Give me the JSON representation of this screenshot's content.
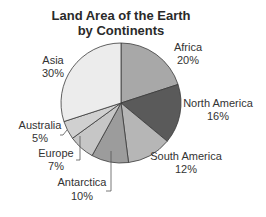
{
  "chart_data": {
    "type": "pie",
    "title": "Land Area of the Earth by Continents",
    "title_lines": [
      "Land Area of the Earth",
      "by Continents"
    ],
    "start_angle_deg": 0,
    "direction": "clockwise",
    "slices": [
      {
        "label": "Africa",
        "value": 20,
        "value_label": "20%",
        "color": "#a8a8a8"
      },
      {
        "label": "North America",
        "value": 16,
        "value_label": "16%",
        "color": "#5a5a5a"
      },
      {
        "label": "South America",
        "value": 12,
        "value_label": "12%",
        "color": "#b6b6b6"
      },
      {
        "label": "Antarctica",
        "value": 10,
        "value_label": "10%",
        "color": "#9c9c9c"
      },
      {
        "label": "Europe",
        "value": 7,
        "value_label": "7%",
        "color": "#c6c6c6"
      },
      {
        "label": "Australia",
        "value": 5,
        "value_label": "5%",
        "color": "#d0d0d0"
      },
      {
        "label": "Asia",
        "value": 30,
        "value_label": "30%",
        "color": "#ececec"
      }
    ],
    "categories": [
      "Africa",
      "North America",
      "South America",
      "Antarctica",
      "Europe",
      "Australia",
      "Asia"
    ],
    "values": [
      20,
      16,
      12,
      10,
      7,
      5,
      30
    ],
    "unit": "%",
    "legend": "none (direct labels)"
  },
  "layout": {
    "center": [
      121,
      103
    ],
    "radius": 60,
    "labels": [
      {
        "x": 188,
        "y1": 51,
        "y2": 64
      },
      {
        "x": 218,
        "y1": 107,
        "y2": 120
      },
      {
        "x": 186,
        "y1": 160,
        "y2": 173
      },
      {
        "x": 82,
        "y1": 186,
        "y2": 200
      },
      {
        "x": 56,
        "y1": 157,
        "y2": 170
      },
      {
        "x": 40,
        "y1": 129,
        "y2": 142
      },
      {
        "x": 53,
        "y1": 64,
        "y2": 77
      }
    ]
  }
}
